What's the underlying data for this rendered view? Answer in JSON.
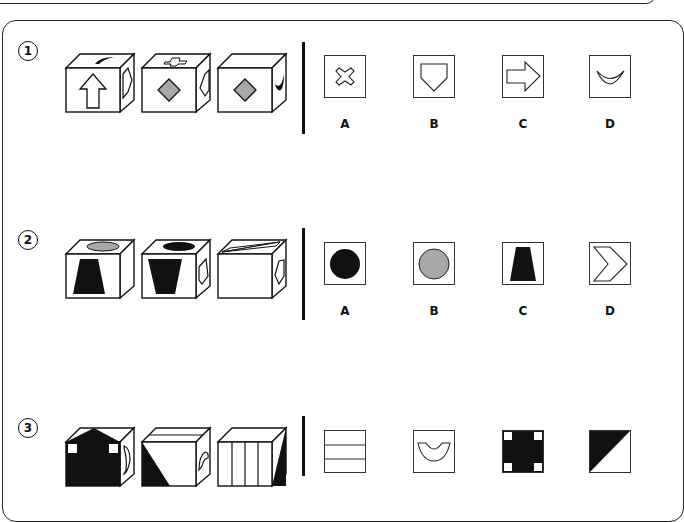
{
  "questions": [
    {
      "number": "1",
      "cubes": [
        {
          "front": "up-arrow",
          "top": "black-crescent",
          "right": "pentagon-outline"
        },
        {
          "front": "gray-diamond",
          "top": "cross-outline",
          "right": "hexagon-outline"
        },
        {
          "front": "gray-diamond",
          "top": "blank",
          "right": "black-crescent"
        }
      ],
      "options": [
        {
          "label": "A",
          "shape": "cross-outline"
        },
        {
          "label": "B",
          "shape": "pentagon-outline"
        },
        {
          "label": "C",
          "shape": "right-arrow-outline"
        },
        {
          "label": "D",
          "shape": "crescent-outline"
        }
      ]
    },
    {
      "number": "2",
      "cubes": [
        {
          "front": "black-trapezoid",
          "top": "gray-ellipse",
          "right": "blank"
        },
        {
          "front": "black-inverted-trapezoid",
          "top": "black-ellipse",
          "right": "pentagon-outline"
        },
        {
          "front": "blank",
          "top": "chevron-outline",
          "right": "pentagon-outline"
        }
      ],
      "options": [
        {
          "label": "A",
          "shape": "black-circle"
        },
        {
          "label": "B",
          "shape": "gray-circle"
        },
        {
          "label": "C",
          "shape": "black-trapezoid"
        },
        {
          "label": "D",
          "shape": "chevron-outline"
        }
      ]
    },
    {
      "number": "3",
      "cubes": [
        {
          "front": "black-cross-with-white-corners",
          "top": "black-triangle",
          "right": "curve"
        },
        {
          "front": "black-diagonal-triangle",
          "top": "horizontal-stripes",
          "right": "semicircle-arc"
        },
        {
          "front": "vertical-stripes",
          "top": "blank",
          "right": "black-diagonal-triangle"
        }
      ],
      "options": [
        {
          "label": "A",
          "shape": "horizontal-stripes"
        },
        {
          "label": "B",
          "shape": "semicircle-arc"
        },
        {
          "label": "C",
          "shape": "black-cross-with-white-corners"
        },
        {
          "label": "D",
          "shape": "black-diagonal-triangle"
        }
      ]
    }
  ],
  "colors": {
    "ink": "#111111",
    "gray_fill": "#a8a8a8",
    "background": "#ffffff"
  }
}
